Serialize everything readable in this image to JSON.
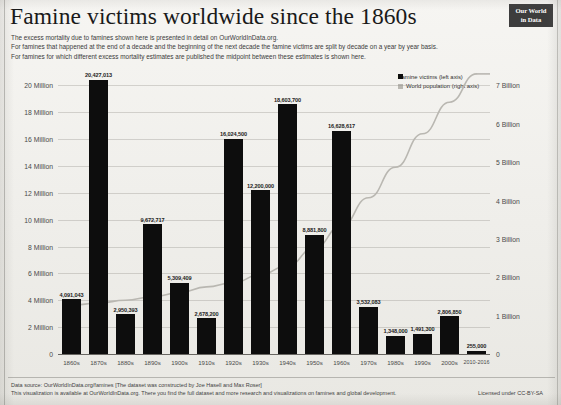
{
  "header": {
    "title": "Famine victims worldwide since the 1860s",
    "subtitle_lines": [
      "The excess mortality due to famines shown here is presented in detail on OurWorldInData.org.",
      "For famines that happened at the end of a decade and the beginning of the next decade the famine victims are split by decade on a year by year basis.",
      "For famines for which different excess mortality estimates are published the midpoint between these estimates is shown here."
    ],
    "logo_line1": "Our World",
    "logo_line2": "in Data"
  },
  "footer": {
    "line1": "Data source: OurWorldInData.org/famines [The dataset was constructed by Joe Hasell and Max Roser]",
    "line2": "This visualization is available at OurWorldInData.org. There you find the full dataset and more research and visualizations on famines and global development.",
    "license": "Licensed under CC-BY-SA"
  },
  "chart_data": {
    "type": "bar",
    "title": "Famine victims worldwide since the 1860s",
    "xlabel": "",
    "ylabel": "Famine victims (left axis)",
    "ylabel_right": "World population (right axis)",
    "ylim": [
      0,
      21000000
    ],
    "ylim_right": [
      0,
      7350000000
    ],
    "grid": true,
    "legend_position": "top-right",
    "categories": [
      "1860s",
      "1870s",
      "1880s",
      "1890s",
      "1900s",
      "1910s",
      "1920s",
      "1930s",
      "1940s",
      "1950s",
      "1960s",
      "1970s",
      "1980s",
      "1990s",
      "2000s",
      "2010-2016"
    ],
    "series": [
      {
        "name": "Famine victims (left axis)",
        "type": "bar",
        "axis": "left",
        "color": "#0d0d0d",
        "values": [
          4091043,
          20427013,
          2950393,
          9672717,
          5309409,
          2678200,
          16024500,
          12200000,
          18603700,
          8881800,
          16628617,
          3532083,
          1348000,
          1491300,
          2806850,
          255000
        ],
        "value_labels": [
          "4,091,043",
          "20,427,013",
          "2,950,393",
          "9,672,717",
          "5,309,409",
          "2,678,200",
          "16,024,500",
          "12,200,000",
          "18,603,700",
          "8,881,800",
          "16,628,617",
          "3,532,083",
          "1,348,000",
          "1,491,300",
          "2,806,850",
          "255,000"
        ]
      },
      {
        "name": "World population (right axis)",
        "type": "line",
        "axis": "right",
        "color": "#b9b7b1",
        "values": [
          1270000000,
          1330000000,
          1400000000,
          1490000000,
          1600000000,
          1750000000,
          1860000000,
          2070000000,
          2300000000,
          2770000000,
          3340000000,
          4070000000,
          4870000000,
          5740000000,
          6560000000,
          7300000000
        ]
      }
    ],
    "yticks_left": [
      {
        "value": 0,
        "label": "0"
      },
      {
        "value": 2000000,
        "label": "2 Million"
      },
      {
        "value": 4000000,
        "label": "4 Million"
      },
      {
        "value": 6000000,
        "label": "6 Million"
      },
      {
        "value": 8000000,
        "label": "8 Million"
      },
      {
        "value": 10000000,
        "label": "10 Million"
      },
      {
        "value": 12000000,
        "label": "12 Million"
      },
      {
        "value": 14000000,
        "label": "14 Million"
      },
      {
        "value": 16000000,
        "label": "16 Million"
      },
      {
        "value": 18000000,
        "label": "18 Million"
      },
      {
        "value": 20000000,
        "label": "20 Million"
      }
    ],
    "yticks_right": [
      {
        "value": 0,
        "label": "0"
      },
      {
        "value": 1000000000,
        "label": "1 Billion"
      },
      {
        "value": 2000000000,
        "label": "2 Billion"
      },
      {
        "value": 3000000000,
        "label": "3 Billion"
      },
      {
        "value": 4000000000,
        "label": "4 Billion"
      },
      {
        "value": 5000000000,
        "label": "5 Billion"
      },
      {
        "value": 6000000000,
        "label": "6 Billion"
      },
      {
        "value": 7000000000,
        "label": "7 Billion"
      }
    ],
    "legend": [
      {
        "label": "Famine victims (left axis)",
        "marker": "bar",
        "color": "#0d0d0d"
      },
      {
        "label": "World population (right axis)",
        "marker": "line",
        "color": "#b9b7b1"
      }
    ]
  }
}
